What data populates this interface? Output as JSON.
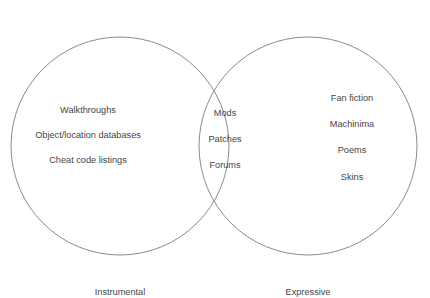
{
  "figure": {
    "type": "venn-diagram",
    "background_color": "#ffffff",
    "stroke_color": "#8a8a8a",
    "text_color": "#454545"
  },
  "left_set": {
    "label": "Instrumental",
    "items": [
      "Walkthroughs",
      "Object/location databases",
      "Cheat code listings"
    ]
  },
  "right_set": {
    "label": "Expressive",
    "items": [
      "Fan fiction",
      "Machinima",
      "Poems",
      "Skins"
    ]
  },
  "intersection": {
    "items": [
      "Mods",
      "Patches",
      "Forums"
    ]
  }
}
